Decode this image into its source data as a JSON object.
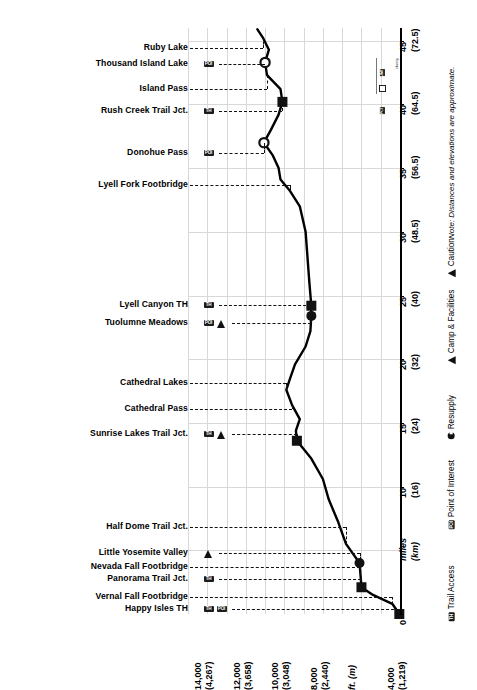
{
  "chart": {
    "type": "line",
    "orientation": "rotated-90",
    "title": "",
    "note": "Note: Distances and elevations are approximate.",
    "xlabel_primary": "miles",
    "xlabel_secondary": "(km)",
    "ylabel": "ft. (m)",
    "x_ticks": [
      {
        "miles": "0",
        "km": ""
      },
      {
        "miles": "miles",
        "km": "(km)"
      },
      {
        "miles": "10",
        "km": "(16)"
      },
      {
        "miles": "15",
        "km": "(24)"
      },
      {
        "miles": "20",
        "km": "(32)"
      },
      {
        "miles": "25",
        "km": "(40)"
      },
      {
        "miles": "30",
        "km": "(48.5)"
      },
      {
        "miles": "35",
        "km": "(56.5)"
      },
      {
        "miles": "40",
        "km": "(64.5)"
      },
      {
        "miles": "45",
        "km": "(72.5)"
      }
    ],
    "y_ticks": [
      {
        "ft": "14,000",
        "m": "(4,267)"
      },
      {
        "ft": "12,000",
        "m": "(3,658)"
      },
      {
        "ft": "10,000",
        "m": "(3,048)"
      },
      {
        "ft": "8,000",
        "m": "(2,440)"
      },
      {
        "ft": "ft. (m)",
        "m": ""
      },
      {
        "ft": "4,000",
        "m": "(1,219)"
      }
    ],
    "xlim_miles": [
      0,
      46
    ],
    "ylim_ft": [
      4000,
      15000
    ],
    "grid": true
  },
  "chart_data": {
    "type": "line",
    "xlabel": "miles (km)",
    "ylabel": "ft. (m)",
    "xlim": [
      0,
      46
    ],
    "ylim": [
      4000,
      15000
    ],
    "grid": true,
    "legend_position": "bottom-right",
    "x": [
      0,
      0.8,
      1.5,
      2.1,
      4.0,
      5.5,
      7.2,
      9.0,
      10.6,
      12.2,
      13.6,
      14.4,
      15.3,
      16.4,
      17.6,
      18.5,
      19.6,
      21.0,
      22.2,
      23.4,
      24.2,
      26.0,
      28.0,
      30.0,
      32.0,
      33.2,
      34.1,
      35.0,
      36.0,
      37.0,
      38.0,
      39.2,
      40.2,
      41.2,
      42.3,
      43.3,
      44.3,
      45.2,
      45.9
    ],
    "y": [
      4035,
      4400,
      5400,
      6000,
      6100,
      6800,
      7200,
      7700,
      8000,
      8600,
      9350,
      9400,
      9200,
      9600,
      9900,
      9700,
      9450,
      8900,
      8650,
      8600,
      8600,
      8700,
      8800,
      8900,
      9200,
      9700,
      10200,
      10300,
      10600,
      11060,
      10700,
      10300,
      10100,
      10200,
      10900,
      11000,
      10800,
      11100,
      11400
    ],
    "series_name": "Elevation",
    "annotations": [
      {
        "label": "Happy Isles TH",
        "miles": 0.0,
        "ft": 4035,
        "marker": "square-filled",
        "icons": [
          "TH",
          "POI"
        ]
      },
      {
        "label": "Vernal Fall Footbridge",
        "miles": 0.8,
        "ft": 4400,
        "marker": "none",
        "icons": []
      },
      {
        "label": "Panorama Trail Jct.",
        "miles": 2.1,
        "ft": 6000,
        "marker": "square-filled",
        "icons": [
          "TH"
        ]
      },
      {
        "label": "Nevada Fall Footbridge",
        "miles": 2.6,
        "ft": 6100,
        "marker": "none",
        "icons": []
      },
      {
        "label": "Little Yosemite Valley",
        "miles": 4.0,
        "ft": 6100,
        "marker": "circle-filled",
        "icons": [
          "CAMP"
        ]
      },
      {
        "label": "Half Dome Trail Jct.",
        "miles": 5.5,
        "ft": 6800,
        "marker": "none",
        "icons": []
      },
      {
        "label": "Sunrise Lakes Trail Jct.",
        "miles": 13.6,
        "ft": 9350,
        "marker": "square-filled",
        "icons": [
          "TH",
          "CAMP"
        ]
      },
      {
        "label": "Cathedral Pass",
        "miles": 16.4,
        "ft": 9600,
        "marker": "none",
        "icons": []
      },
      {
        "label": "Cathedral Lakes",
        "miles": 17.6,
        "ft": 9900,
        "marker": "none",
        "icons": []
      },
      {
        "label": "Tuolumne Meadows",
        "miles": 23.4,
        "ft": 8600,
        "marker": "circle-filled",
        "icons": [
          "POI",
          "CAMP"
        ]
      },
      {
        "label": "Lyell Canyon TH",
        "miles": 24.2,
        "ft": 8600,
        "marker": "square-filled",
        "icons": [
          "TH"
        ]
      },
      {
        "label": "Lyell Fork Footbridge",
        "miles": 33.2,
        "ft": 9700,
        "marker": "none",
        "icons": []
      },
      {
        "label": "Donohue Pass",
        "miles": 37.0,
        "ft": 11060,
        "marker": "circle-open",
        "icons": [
          "POI"
        ]
      },
      {
        "label": "Rush Creek Trail Jct.",
        "miles": 40.2,
        "ft": 10100,
        "marker": "square-filled",
        "icons": [
          "TH"
        ]
      },
      {
        "label": "Island Pass",
        "miles": 42.3,
        "ft": 10900,
        "marker": "none",
        "icons": []
      },
      {
        "label": "Thousand Island Lake",
        "miles": 43.3,
        "ft": 11000,
        "marker": "circle-open",
        "icons": [
          "POI"
        ]
      },
      {
        "label": "Ruby Lake",
        "miles": 45.2,
        "ft": 11100,
        "marker": "none",
        "icons": []
      }
    ]
  },
  "labels": [
    {
      "name": "ruby-lake",
      "text": "Ruby Lake",
      "icons": []
    },
    {
      "name": "thousand-island-lake",
      "text": "Thousand Island Lake",
      "icons": [
        "POI"
      ]
    },
    {
      "name": "island-pass",
      "text": "Island Pass",
      "icons": []
    },
    {
      "name": "rush-creek-trail-jct",
      "text": "Rush Creek Trail Jct.",
      "icons": [
        "TH"
      ]
    },
    {
      "name": "donohue-pass",
      "text": "Donohue Pass",
      "icons": [
        "POI"
      ]
    },
    {
      "name": "lyell-fork-footbridge",
      "text": "Lyell Fork Footbridge",
      "icons": []
    },
    {
      "name": "lyell-canyon-th",
      "text": "Lyell Canyon TH",
      "icons": [
        "TH"
      ]
    },
    {
      "name": "tuolumne-meadows",
      "text": "Tuolumne Meadows",
      "icons": [
        "POI",
        "CAMP"
      ]
    },
    {
      "name": "cathedral-lakes",
      "text": "Cathedral Lakes",
      "icons": []
    },
    {
      "name": "cathedral-pass",
      "text": "Cathedral Pass",
      "icons": []
    },
    {
      "name": "sunrise-lakes-trail-jct",
      "text": "Sunrise Lakes Trail Jct.",
      "icons": [
        "TH",
        "CAMP"
      ]
    },
    {
      "name": "half-dome-trail-jct",
      "text": "Half Dome Trail Jct.",
      "icons": []
    },
    {
      "name": "little-yosemite-valley",
      "text": "Little Yosemite Valley",
      "icons": [
        "CAMP"
      ]
    },
    {
      "name": "nevada-fall-footbridge",
      "text": "Nevada Fall Footbridge",
      "icons": []
    },
    {
      "name": "panorama-trail-jct",
      "text": "Panorama Trail Jct.",
      "icons": [
        "TH"
      ]
    },
    {
      "name": "vernal-fall-footbridge",
      "text": "Vernal Fall Footbridge",
      "icons": []
    },
    {
      "name": "happy-isles-th",
      "text": "Happy Isles TH",
      "icons": [
        "TH",
        "POI"
      ]
    }
  ],
  "legend": {
    "items": [
      {
        "name": "trail-access",
        "label": "Trail Access",
        "icon": "TH"
      },
      {
        "name": "point-of-interest",
        "label": "Point of Interest",
        "icon": "POI"
      },
      {
        "name": "resupply",
        "label": "Resupply",
        "icon": "circle"
      },
      {
        "name": "camp-facilities",
        "label": "Camp & Facilities",
        "icon": "triangle"
      },
      {
        "name": "caution",
        "label": "Caution",
        "icon": "triangle"
      }
    ]
  },
  "route_tag": {
    "jmt": "JMT",
    "pct": "PCT",
    "caption": "sharing"
  },
  "colors": {
    "line": "#000000",
    "grid": "#d8d8d8",
    "text": "#000000",
    "marker_fill": "#111111",
    "background": "#ffffff"
  }
}
